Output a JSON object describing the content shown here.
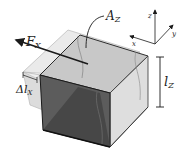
{
  "figure": {
    "type": "shear-deformation-diagram",
    "labels": {
      "force": "F",
      "force_sub": "X",
      "area": "A",
      "area_sub": "Z",
      "displacement": "Δl",
      "displacement_sub": "X",
      "height": "l",
      "height_sub": "Z"
    },
    "axes": {
      "x": "x",
      "y": "y",
      "z": "z"
    },
    "colors": {
      "front_face": "#5a5a5a",
      "side_face": "#d8d8d8",
      "top_face": "#c4c4c4",
      "ghost": "#e6e6e6",
      "edge": "#1a1a1a"
    }
  }
}
